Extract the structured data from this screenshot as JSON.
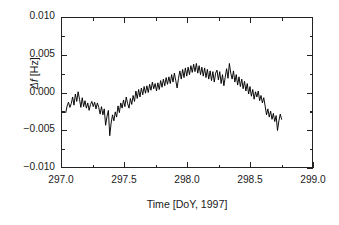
{
  "chart_data": {
    "type": "line",
    "title": "",
    "xlabel": "Time [DoY, 1997]",
    "ylabel_delta": "Δ",
    "ylabel_f": "f",
    "ylabel_unit": " [Hz]",
    "ylabel": "Δf [Hz]",
    "xlim": [
      297.0,
      299.0
    ],
    "ylim": [
      -0.01,
      0.01
    ],
    "xticks": [
      297.0,
      297.5,
      298.0,
      298.5,
      299.0
    ],
    "xtick_labels": [
      "297.0",
      "297.5",
      "298.0",
      "298.5",
      "299.0"
    ],
    "yticks": [
      -0.01,
      -0.005,
      0.0,
      0.005,
      0.01
    ],
    "ytick_labels": [
      "−0.010",
      "−0.005",
      "0.000",
      "0.005",
      "0.010"
    ],
    "x_minor_ticks": [
      297.25,
      297.75,
      298.25,
      298.75
    ],
    "y_minor_ticks": [
      -0.0075,
      -0.0025,
      0.0025,
      0.0075
    ],
    "grid": false,
    "legend": false,
    "line_color": "#000000",
    "line_width": 0.9,
    "series": [
      {
        "name": "Δf",
        "x": [
          297.03,
          297.041,
          297.052,
          297.063,
          297.074,
          297.085,
          297.096,
          297.107,
          297.118,
          297.129,
          297.14,
          297.151,
          297.162,
          297.173,
          297.184,
          297.195,
          297.206,
          297.217,
          297.228,
          297.239,
          297.25,
          297.261,
          297.272,
          297.283,
          297.294,
          297.305,
          297.316,
          297.327,
          297.338,
          297.349,
          297.36,
          297.371,
          297.382,
          297.393,
          297.404,
          297.415,
          297.426,
          297.437,
          297.448,
          297.459,
          297.47,
          297.481,
          297.492,
          297.503,
          297.514,
          297.525,
          297.536,
          297.547,
          297.558,
          297.569,
          297.58,
          297.591,
          297.602,
          297.613,
          297.624,
          297.635,
          297.646,
          297.657,
          297.668,
          297.679,
          297.69,
          297.701,
          297.712,
          297.723,
          297.734,
          297.745,
          297.756,
          297.767,
          297.778,
          297.789,
          297.8,
          297.811,
          297.822,
          297.833,
          297.844,
          297.855,
          297.866,
          297.877,
          297.888,
          297.899,
          297.91,
          297.921,
          297.932,
          297.943,
          297.954,
          297.965,
          297.976,
          297.987,
          297.998,
          298.009,
          298.02,
          298.031,
          298.042,
          298.053,
          298.064,
          298.075,
          298.086,
          298.097,
          298.108,
          298.119,
          298.13,
          298.141,
          298.152,
          298.163,
          298.174,
          298.185,
          298.196,
          298.207,
          298.218,
          298.229,
          298.24,
          298.251,
          298.262,
          298.273,
          298.284,
          298.295,
          298.306,
          298.317,
          298.328,
          298.339,
          298.35,
          298.361,
          298.372,
          298.383,
          298.394,
          298.405,
          298.416,
          298.427,
          298.438,
          298.449,
          298.46,
          298.471,
          298.482,
          298.493,
          298.504,
          298.515,
          298.526,
          298.537,
          298.548,
          298.559,
          298.57,
          298.581,
          298.592,
          298.603,
          298.614,
          298.625,
          298.636,
          298.647,
          298.658,
          298.669,
          298.68,
          298.691,
          298.702,
          298.713,
          298.724,
          298.735,
          298.746,
          298.757
        ],
        "y": [
          -0.0027,
          -0.0018,
          -0.0013,
          -0.002,
          -0.0015,
          -0.0006,
          -0.0017,
          -0.0002,
          -0.0012,
          0.0001,
          -0.0009,
          -0.002,
          -0.0007,
          -0.0019,
          -0.0011,
          -0.0021,
          -0.0014,
          -0.0024,
          -0.0016,
          -0.0012,
          -0.0019,
          -0.0013,
          -0.0022,
          -0.0014,
          -0.002,
          -0.0029,
          -0.0019,
          -0.003,
          -0.0022,
          -0.0044,
          -0.0032,
          -0.0024,
          -0.0058,
          -0.0041,
          -0.003,
          -0.0038,
          -0.0026,
          -0.0033,
          -0.0018,
          -0.0027,
          -0.0014,
          -0.0021,
          -0.001,
          -0.0019,
          -0.0006,
          -0.0015,
          -0.0021,
          -0.0008,
          -0.0016,
          -0.0004,
          -0.0012,
          0.0002,
          -0.0008,
          0.0004,
          -0.0006,
          0.0006,
          -0.0003,
          0.0008,
          -0.0001,
          0.0009,
          0.0,
          0.0011,
          0.0003,
          0.0014,
          0.0005,
          0.0012,
          0.0002,
          0.0013,
          0.0004,
          0.0016,
          0.0007,
          0.0018,
          0.0009,
          0.002,
          0.0011,
          0.0021,
          0.0012,
          0.0024,
          0.0014,
          0.0026,
          0.0016,
          0.0006,
          0.0019,
          0.0029,
          0.0018,
          0.0031,
          0.002,
          0.0033,
          0.0022,
          0.0034,
          0.0024,
          0.0036,
          0.0027,
          0.0038,
          0.0028,
          0.0039,
          0.0026,
          0.0036,
          0.0024,
          0.0034,
          0.0022,
          0.0033,
          0.002,
          0.0031,
          0.0018,
          0.0029,
          0.0016,
          0.0028,
          0.0014,
          0.0026,
          0.003,
          0.0017,
          0.0028,
          0.0012,
          0.0024,
          0.0009,
          0.0021,
          0.0032,
          0.0019,
          0.0039,
          0.0026,
          0.0018,
          0.0029,
          0.0014,
          0.0024,
          0.001,
          0.0021,
          0.0008,
          0.0018,
          0.0005,
          0.0015,
          0.0002,
          0.0012,
          -0.0002,
          0.0008,
          -0.0005,
          0.0004,
          -0.0009,
          0.0001,
          -0.0006,
          0.0002,
          -0.0011,
          -0.0004,
          -0.0014,
          -0.0007,
          -0.0018,
          -0.003,
          -0.0022,
          -0.0033,
          -0.0025,
          -0.0036,
          -0.0028,
          -0.0039,
          -0.0031,
          -0.0051,
          -0.0038,
          -0.0029,
          -0.0036
        ]
      }
    ]
  }
}
